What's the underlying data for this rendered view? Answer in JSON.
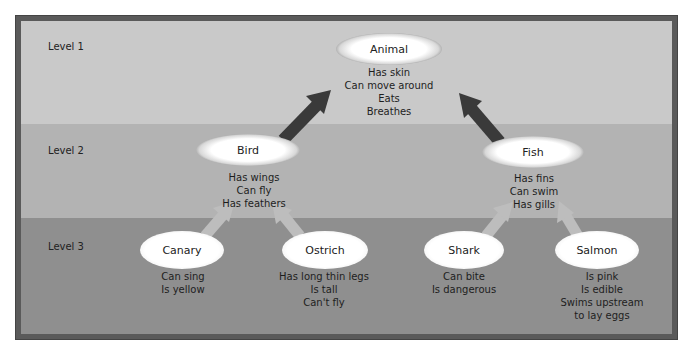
{
  "diagram": {
    "levels": [
      {
        "label": "Level 1"
      },
      {
        "label": "Level 2"
      },
      {
        "label": "Level 3"
      }
    ],
    "colors": {
      "level1_bg": "#c9c9c9",
      "level2_bg": "#b3b3b3",
      "level3_bg": "#8f8f8f",
      "frame": "#5a5a5a",
      "arrow_dark": "#3a3a3a",
      "arrow_light": "#bdbdbd"
    },
    "nodes": {
      "animal": {
        "label": "Animal",
        "level": 1,
        "attributes": [
          "Has skin",
          "Can move around",
          "Eats",
          "Breathes"
        ]
      },
      "bird": {
        "label": "Bird",
        "level": 2,
        "attributes": [
          "Has wings",
          "Can fly",
          "Has feathers"
        ]
      },
      "fish": {
        "label": "Fish",
        "level": 2,
        "attributes": [
          "Has fins",
          "Can swim",
          "Has gills"
        ]
      },
      "canary": {
        "label": "Canary",
        "level": 3,
        "attributes": [
          "Can sing",
          "Is yellow"
        ]
      },
      "ostrich": {
        "label": "Ostrich",
        "level": 3,
        "attributes": [
          "Has long thin legs",
          "Is tall",
          "Can't fly"
        ]
      },
      "shark": {
        "label": "Shark",
        "level": 3,
        "attributes": [
          "Can bite",
          "Is dangerous"
        ]
      },
      "salmon": {
        "label": "Salmon",
        "level": 3,
        "attributes": [
          "Is pink",
          "Is edible",
          "Swims upstream",
          "to lay eggs"
        ]
      }
    },
    "edges": [
      {
        "from": "bird",
        "to": "animal"
      },
      {
        "from": "fish",
        "to": "animal"
      },
      {
        "from": "canary",
        "to": "bird"
      },
      {
        "from": "ostrich",
        "to": "bird"
      },
      {
        "from": "shark",
        "to": "fish"
      },
      {
        "from": "salmon",
        "to": "fish"
      }
    ]
  }
}
